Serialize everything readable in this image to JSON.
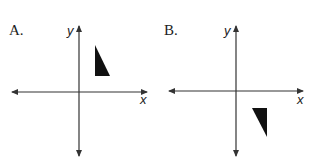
{
  "panels": [
    {
      "label": "A.",
      "y_axis_label": "y",
      "x_axis_label": "x",
      "triangle_position": "quadrant I (above x-axis, right of y-axis)",
      "triangle_points": "95,45 95,76 110,76"
    },
    {
      "label": "B.",
      "y_axis_label": "y",
      "x_axis_label": "x",
      "triangle_position": "quadrant IV (below x-axis, right of y-axis)",
      "triangle_points": "252,108 267,108 267,137"
    }
  ],
  "colors": {
    "axis": "#333333",
    "fill": "#111111"
  }
}
